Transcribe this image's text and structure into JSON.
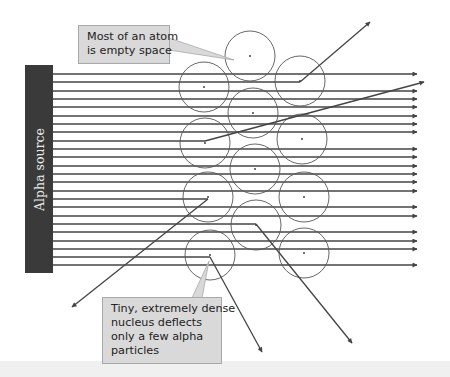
{
  "diagram": {
    "source": {
      "label": "Alpha source",
      "color": "#3a3a3a",
      "x": 25,
      "y": 65,
      "width": 28,
      "height": 208
    },
    "callouts": {
      "empty_space": {
        "lines": [
          "Most of an atom",
          "is empty space"
        ]
      },
      "nucleus": {
        "lines": [
          "Tiny, extremely dense",
          "nucleus deflects",
          "only a few alpha",
          "particles"
        ]
      }
    },
    "colors": {
      "beam": "#444444",
      "atom": "#555555",
      "callout_fill": "#d9d9d9",
      "callout_border": "#a8a8a8"
    },
    "beam_start_x": 53,
    "beam_end_x": 417,
    "beams_y": [
      74,
      82,
      91,
      99,
      107,
      116,
      124,
      132,
      141,
      149,
      157,
      166,
      174,
      182,
      191,
      199,
      207,
      216,
      224,
      232,
      241,
      249,
      257,
      265
    ],
    "atoms": [
      {
        "cx": 250,
        "cy": 56,
        "r": 25
      },
      {
        "cx": 204,
        "cy": 87,
        "r": 25
      },
      {
        "cx": 300,
        "cy": 81,
        "r": 25
      },
      {
        "cx": 253,
        "cy": 113,
        "r": 25
      },
      {
        "cx": 205,
        "cy": 143,
        "r": 25
      },
      {
        "cx": 302,
        "cy": 139,
        "r": 25
      },
      {
        "cx": 255,
        "cy": 169,
        "r": 25
      },
      {
        "cx": 208,
        "cy": 197,
        "r": 25
      },
      {
        "cx": 304,
        "cy": 197,
        "r": 25
      },
      {
        "cx": 256,
        "cy": 225,
        "r": 25
      },
      {
        "cx": 210,
        "cy": 255,
        "r": 25
      },
      {
        "cx": 304,
        "cy": 253,
        "r": 25
      }
    ],
    "deflections": [
      {
        "from_y": 82,
        "hit_x": 300,
        "to": [
          370,
          22
        ]
      },
      {
        "from_y": 141,
        "hit_x": 205,
        "to": [
          424,
          82
        ]
      },
      {
        "from_y": 199,
        "hit_x": 208,
        "to": [
          72,
          307
        ]
      },
      {
        "from_y": 224,
        "hit_x": 256,
        "to": [
          352,
          343
        ]
      },
      {
        "from_y": 257,
        "hit_x": 210,
        "to": [
          262,
          352
        ]
      }
    ]
  }
}
